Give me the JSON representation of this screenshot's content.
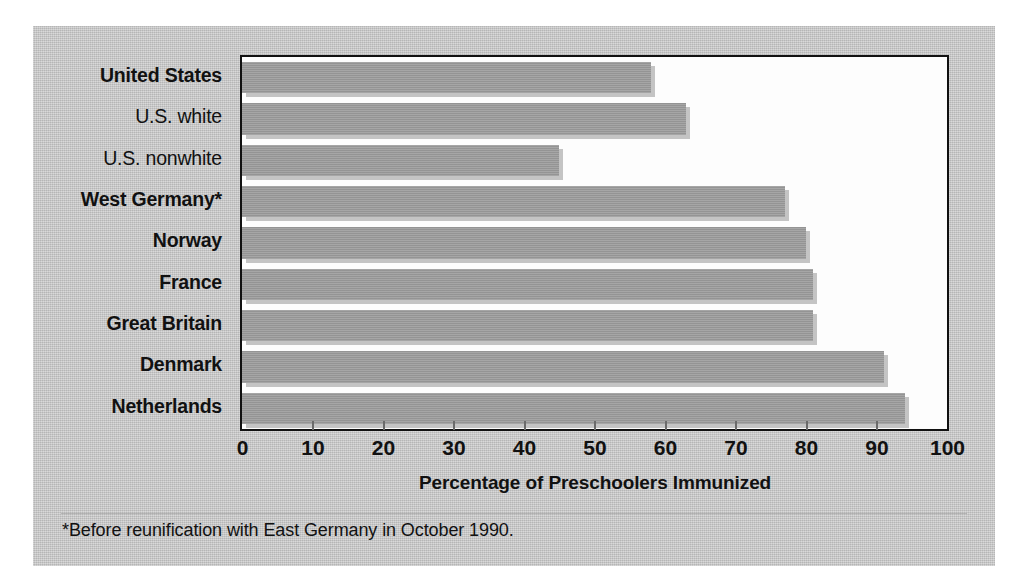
{
  "figure": {
    "footnote": "*Before reunification with East Germany in October 1990.",
    "panel_color": "#c3c3c3",
    "bar_color": "#9c9c9c",
    "plot_background": "#fdfdfd",
    "axis_color": "#111111"
  },
  "chart_data": {
    "type": "bar",
    "orientation": "horizontal",
    "title": "",
    "xlabel": "Percentage of Preschoolers Immunized",
    "ylabel": "",
    "xlim": [
      0,
      100
    ],
    "xticks": [
      0,
      10,
      20,
      30,
      40,
      50,
      60,
      70,
      80,
      90,
      100
    ],
    "xtick_labels": [
      "0",
      "10",
      "20",
      "30",
      "40",
      "50",
      "60",
      "70",
      "80",
      "90",
      "100"
    ],
    "grid": false,
    "legend": false,
    "categories": [
      "United States",
      "U.S. white",
      "U.S. nonwhite",
      "West Germany*",
      "Norway",
      "France",
      "Great Britain",
      "Denmark",
      "Netherlands"
    ],
    "category_styles": [
      "bold",
      "regular",
      "regular",
      "bold",
      "bold",
      "bold",
      "bold",
      "bold",
      "bold"
    ],
    "values": [
      58,
      63,
      45,
      77,
      80,
      81,
      81,
      91,
      94
    ]
  }
}
